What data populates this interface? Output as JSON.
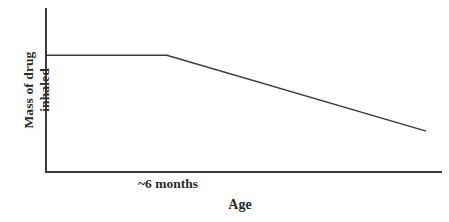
{
  "chart_data": {
    "type": "line",
    "title": "",
    "subtitle": "",
    "xlabel": "Age",
    "ylabel": "Mass of drug inhaled",
    "ylabel_lines": [
      "Mass of drug",
      "inhaled"
    ],
    "xtick_labels": [
      "~6 months"
    ],
    "ytick_labels": [],
    "grid": false,
    "legend": "none",
    "axes_style": "open-L (left spine and bottom spine only, no ticks, no numeric scale)",
    "xlim": [
      0,
      1
    ],
    "ylim": [
      0,
      1
    ],
    "annotations": [
      "~6 months marks the x position where the curve stops being flat and begins to decline"
    ],
    "series": [
      {
        "name": "Mass of drug inhaled vs age",
        "color": "#3a3a3a",
        "line_width": 1.4,
        "description": "Constant plateau until about 6 months of age, then a steady linear decline thereafter",
        "points": [
          {
            "x": 0.0,
            "y": 0.71,
            "label": "birth"
          },
          {
            "x": 0.305,
            "y": 0.71,
            "label": "~6 months"
          },
          {
            "x": 0.96,
            "y": 0.245,
            "label": "end"
          }
        ],
        "x": [
          0.0,
          0.305,
          0.96
        ],
        "values": [
          0.71,
          0.71,
          0.245
        ]
      }
    ]
  },
  "colors": {
    "background": "#ffffff",
    "axis": "#3a3a3a",
    "line": "#3a3a3a",
    "text": "#2b2b2b"
  },
  "labels": {
    "y_axis_line1": "Mass of drug",
    "y_axis_line2": "inhaled",
    "x_tick_six_months": "~6 months",
    "x_axis_title": "Age"
  }
}
